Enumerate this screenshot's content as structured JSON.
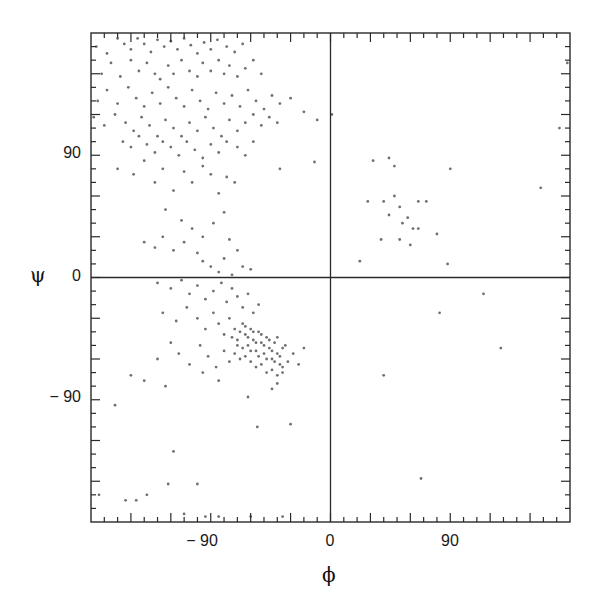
{
  "chart_data": {
    "type": "scatter",
    "title": "",
    "xlabel": "ϕ",
    "ylabel": "ψ",
    "xlim": [
      -180,
      180
    ],
    "ylim": [
      -180,
      180
    ],
    "grid": false,
    "zero_lines": true,
    "x_ticks": [
      -90,
      0,
      90
    ],
    "x_tick_labels": [
      "− 90",
      "0",
      "90"
    ],
    "y_ticks": [
      90,
      0,
      -90
    ],
    "y_tick_labels": [
      "90",
      "0",
      "− 90"
    ],
    "minor_tick_step": 10,
    "major_tick_step": 30,
    "point_color": "#707070",
    "axis_color": "#2a2a2a",
    "series": [
      {
        "name": "residues",
        "points": [
          [
            -176,
            170
          ],
          [
            -168,
            165
          ],
          [
            -160,
            176
          ],
          [
            -155,
            172
          ],
          [
            -150,
            168
          ],
          [
            -145,
            176
          ],
          [
            -140,
            172
          ],
          [
            -135,
            166
          ],
          [
            -130,
            175
          ],
          [
            -125,
            170
          ],
          [
            -120,
            174
          ],
          [
            -115,
            168
          ],
          [
            -110,
            176
          ],
          [
            -105,
            171
          ],
          [
            -100,
            165
          ],
          [
            -95,
            173
          ],
          [
            -90,
            168
          ],
          [
            -85,
            175
          ],
          [
            -78,
            170
          ],
          [
            -72,
            166
          ],
          [
            -66,
            172
          ],
          [
            -172,
            150
          ],
          [
            -165,
            158
          ],
          [
            -158,
            148
          ],
          [
            -150,
            160
          ],
          [
            -144,
            152
          ],
          [
            -138,
            158
          ],
          [
            -132,
            150
          ],
          [
            -128,
            146
          ],
          [
            -122,
            156
          ],
          [
            -118,
            150
          ],
          [
            -112,
            160
          ],
          [
            -106,
            152
          ],
          [
            -100,
            148
          ],
          [
            -96,
            158
          ],
          [
            -90,
            152
          ],
          [
            -84,
            160
          ],
          [
            -80,
            150
          ],
          [
            -76,
            156
          ],
          [
            -70,
            148
          ],
          [
            -64,
            154
          ],
          [
            -58,
            160
          ],
          [
            -52,
            150
          ],
          [
            -175,
            130
          ],
          [
            -168,
            138
          ],
          [
            -160,
            128
          ],
          [
            -152,
            140
          ],
          [
            -146,
            132
          ],
          [
            -140,
            126
          ],
          [
            -134,
            136
          ],
          [
            -128,
            128
          ],
          [
            -122,
            140
          ],
          [
            -116,
            132
          ],
          [
            -110,
            126
          ],
          [
            -104,
            138
          ],
          [
            -98,
            130
          ],
          [
            -92,
            124
          ],
          [
            -86,
            136
          ],
          [
            -80,
            128
          ],
          [
            -74,
            134
          ],
          [
            -68,
            126
          ],
          [
            -62,
            138
          ],
          [
            -56,
            130
          ],
          [
            -50,
            124
          ],
          [
            -44,
            134
          ],
          [
            -38,
            128
          ],
          [
            -30,
            132
          ],
          [
            -178,
            118
          ],
          [
            -170,
            112
          ],
          [
            -162,
            120
          ],
          [
            -154,
            114
          ],
          [
            -148,
            108
          ],
          [
            -142,
            118
          ],
          [
            -136,
            112
          ],
          [
            -130,
            104
          ],
          [
            -124,
            116
          ],
          [
            -118,
            110
          ],
          [
            -112,
            104
          ],
          [
            -106,
            114
          ],
          [
            -100,
            108
          ],
          [
            -94,
            118
          ],
          [
            -88,
            110
          ],
          [
            -82,
            104
          ],
          [
            -76,
            116
          ],
          [
            -70,
            108
          ],
          [
            -64,
            114
          ],
          [
            -58,
            120
          ],
          [
            -52,
            112
          ],
          [
            -46,
            118
          ],
          [
            -40,
            114
          ],
          [
            -20,
            122
          ],
          [
            -10,
            116
          ],
          [
            1,
            120
          ],
          [
            -156,
            100
          ],
          [
            -150,
            96
          ],
          [
            -144,
            104
          ],
          [
            -138,
            98
          ],
          [
            -132,
            92
          ],
          [
            -126,
            100
          ],
          [
            -120,
            96
          ],
          [
            -114,
            90
          ],
          [
            -108,
            100
          ],
          [
            -102,
            94
          ],
          [
            -96,
            88
          ],
          [
            -90,
            98
          ],
          [
            -84,
            92
          ],
          [
            -78,
            100
          ],
          [
            -70,
            96
          ],
          [
            -64,
            90
          ],
          [
            -58,
            100
          ],
          [
            -160,
            80
          ],
          [
            -148,
            76
          ],
          [
            -140,
            86
          ],
          [
            -132,
            70
          ],
          [
            -126,
            80
          ],
          [
            -118,
            64
          ],
          [
            -110,
            78
          ],
          [
            -104,
            70
          ],
          [
            -96,
            82
          ],
          [
            -90,
            76
          ],
          [
            -84,
            62
          ],
          [
            -78,
            74
          ],
          [
            -72,
            70
          ],
          [
            -38,
            80
          ],
          [
            -12,
            85
          ],
          [
            -124,
            50
          ],
          [
            -112,
            42
          ],
          [
            -104,
            36
          ],
          [
            -96,
            30
          ],
          [
            -88,
            40
          ],
          [
            -80,
            48
          ],
          [
            -76,
            28
          ],
          [
            -70,
            20
          ],
          [
            -140,
            26
          ],
          [
            -132,
            22
          ],
          [
            -126,
            30
          ],
          [
            -118,
            20
          ],
          [
            -110,
            26
          ],
          [
            -100,
            18
          ],
          [
            -96,
            12
          ],
          [
            -90,
            8
          ],
          [
            -84,
            4
          ],
          [
            -80,
            14
          ],
          [
            -74,
            2
          ],
          [
            -66,
            8
          ],
          [
            -60,
            6
          ],
          [
            -130,
            -4
          ],
          [
            -120,
            -8
          ],
          [
            -112,
            -2
          ],
          [
            -106,
            -12
          ],
          [
            -100,
            -6
          ],
          [
            -94,
            -16
          ],
          [
            -88,
            -10
          ],
          [
            -82,
            -4
          ],
          [
            -78,
            -18
          ],
          [
            -74,
            -8
          ],
          [
            -70,
            -14
          ],
          [
            -66,
            -22
          ],
          [
            -62,
            -12
          ],
          [
            -58,
            -26
          ],
          [
            -54,
            -20
          ],
          [
            -126,
            -26
          ],
          [
            -116,
            -32
          ],
          [
            -108,
            -22
          ],
          [
            -100,
            -30
          ],
          [
            -94,
            -38
          ],
          [
            -88,
            -26
          ],
          [
            -84,
            -34
          ],
          [
            -80,
            -42
          ],
          [
            -76,
            -30
          ],
          [
            -72,
            -38
          ],
          [
            -70,
            -46
          ],
          [
            -66,
            -34
          ],
          [
            -64,
            -42
          ],
          [
            -62,
            -50
          ],
          [
            -60,
            -38
          ],
          [
            -58,
            -46
          ],
          [
            -56,
            -54
          ],
          [
            -54,
            -40
          ],
          [
            -52,
            -48
          ],
          [
            -50,
            -56
          ],
          [
            -48,
            -44
          ],
          [
            -46,
            -52
          ],
          [
            -44,
            -60
          ],
          [
            -42,
            -48
          ],
          [
            -40,
            -56
          ],
          [
            -38,
            -64
          ],
          [
            -36,
            -52
          ],
          [
            -74,
            -44
          ],
          [
            -70,
            -50
          ],
          [
            -68,
            -40
          ],
          [
            -66,
            -52
          ],
          [
            -64,
            -36
          ],
          [
            -62,
            -44
          ],
          [
            -60,
            -54
          ],
          [
            -58,
            -40
          ],
          [
            -56,
            -48
          ],
          [
            -54,
            -58
          ],
          [
            -52,
            -42
          ],
          [
            -50,
            -50
          ],
          [
            -48,
            -60
          ],
          [
            -46,
            -46
          ],
          [
            -44,
            -54
          ],
          [
            -42,
            -62
          ],
          [
            -40,
            -44
          ],
          [
            -38,
            -58
          ],
          [
            -36,
            -66
          ],
          [
            -34,
            -50
          ],
          [
            -72,
            -56
          ],
          [
            -68,
            -60
          ],
          [
            -64,
            -58
          ],
          [
            -60,
            -62
          ],
          [
            -56,
            -66
          ],
          [
            -52,
            -64
          ],
          [
            -48,
            -70
          ],
          [
            -44,
            -68
          ],
          [
            -40,
            -72
          ],
          [
            -36,
            -70
          ],
          [
            -32,
            -62
          ],
          [
            -28,
            -56
          ],
          [
            -24,
            -64
          ],
          [
            -20,
            -52
          ],
          [
            -130,
            -60
          ],
          [
            -120,
            -48
          ],
          [
            -114,
            -56
          ],
          [
            -106,
            -64
          ],
          [
            -98,
            -50
          ],
          [
            -92,
            -58
          ],
          [
            -86,
            -66
          ],
          [
            -80,
            -54
          ],
          [
            -76,
            -62
          ],
          [
            -150,
            -72
          ],
          [
            -140,
            -76
          ],
          [
            -124,
            -80
          ],
          [
            -96,
            -70
          ],
          [
            -84,
            -76
          ],
          [
            -62,
            -88
          ],
          [
            -44,
            -82
          ],
          [
            -40,
            -78
          ],
          [
            -162,
            -94
          ],
          [
            -100,
            -152
          ],
          [
            -84,
            -176
          ],
          [
            -60,
            -176
          ],
          [
            -55,
            -110
          ],
          [
            -30,
            -108
          ],
          [
            -118,
            -128
          ],
          [
            -122,
            -152
          ],
          [
            -138,
            -160
          ],
          [
            -146,
            -164
          ],
          [
            -154,
            -164
          ],
          [
            -174,
            -160
          ],
          [
            -36,
            -176
          ],
          [
            -110,
            -174
          ],
          [
            -94,
            -176
          ],
          [
            32,
            86
          ],
          [
            44,
            88
          ],
          [
            48,
            82
          ],
          [
            90,
            80
          ],
          [
            48,
            60
          ],
          [
            28,
            56
          ],
          [
            40,
            56
          ],
          [
            52,
            52
          ],
          [
            66,
            56
          ],
          [
            72,
            56
          ],
          [
            44,
            46
          ],
          [
            58,
            44
          ],
          [
            54,
            40
          ],
          [
            62,
            36
          ],
          [
            66,
            36
          ],
          [
            80,
            32
          ],
          [
            38,
            28
          ],
          [
            52,
            28
          ],
          [
            60,
            24
          ],
          [
            22,
            12
          ],
          [
            88,
            10
          ],
          [
            115,
            -12
          ],
          [
            82,
            -26
          ],
          [
            128,
            -52
          ],
          [
            40,
            -72
          ],
          [
            68,
            -148
          ],
          [
            158,
            66
          ],
          [
            172,
            110
          ],
          [
            178,
            158
          ]
        ]
      }
    ]
  }
}
